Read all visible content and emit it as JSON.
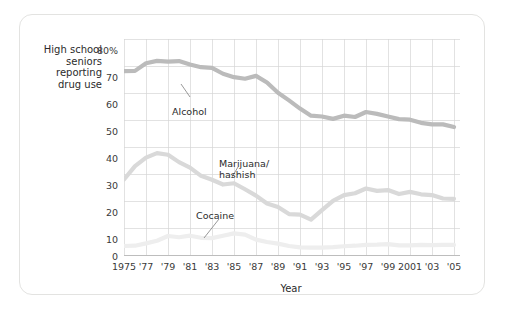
{
  "figure": {
    "y_axis_caption": "High school seniors reporting drug use",
    "y_axis_caption_lines": [
      "High school",
      "seniors",
      "reporting",
      "drug use"
    ],
    "xlabel": "Year"
  },
  "chart_data": {
    "type": "line",
    "title": "",
    "xlabel": "Year",
    "ylabel": "High school seniors reporting drug use",
    "xlim": [
      1975,
      2005
    ],
    "ylim": [
      0,
      80
    ],
    "ytick_labels": [
      "80%",
      "70",
      "60",
      "50",
      "40",
      "30",
      "20",
      "10",
      "0"
    ],
    "ytick_values": [
      80,
      70,
      60,
      50,
      40,
      30,
      20,
      10,
      0
    ],
    "xtick_labels": [
      "1975",
      "'77",
      "'79",
      "'81",
      "'83",
      "'85",
      "'87",
      "'89",
      "'91",
      "'93",
      "'95",
      "'97",
      "'99",
      "2001",
      "'03",
      "'05"
    ],
    "xtick_values": [
      1975,
      1977,
      1979,
      1981,
      1983,
      1985,
      1987,
      1989,
      1991,
      1993,
      1995,
      1997,
      1999,
      2001,
      2003,
      2005
    ],
    "grid": true,
    "legend": "inline-annotations",
    "x": [
      1975,
      1976,
      1977,
      1978,
      1979,
      1980,
      1981,
      1982,
      1983,
      1984,
      1985,
      1986,
      1987,
      1988,
      1989,
      1990,
      1991,
      1992,
      1993,
      1994,
      1995,
      1996,
      1997,
      1998,
      1999,
      2000,
      2001,
      2002,
      2003,
      2004,
      2005
    ],
    "series": [
      {
        "name": "Alcohol",
        "color": "#bbbbbb",
        "values": [
          68.2,
          68.3,
          71.2,
          72.1,
          71.8,
          72.0,
          70.7,
          69.7,
          69.4,
          67.2,
          65.9,
          65.3,
          66.4,
          63.9,
          60.0,
          57.1,
          54.0,
          51.3,
          51.0,
          50.1,
          51.3,
          50.8,
          52.7,
          52.0,
          51.0,
          50.0,
          49.8,
          48.6,
          48.0,
          48.0,
          47.0
        ]
      },
      {
        "name": "Marijuana/hashish",
        "color": "#d9d9d9",
        "values": [
          27.1,
          32.2,
          35.4,
          37.1,
          36.5,
          33.7,
          31.6,
          28.5,
          27.0,
          25.2,
          25.7,
          23.4,
          21.0,
          18.0,
          16.7,
          14.0,
          13.8,
          11.9,
          15.5,
          19.0,
          21.2,
          21.9,
          23.7,
          22.8,
          23.1,
          21.6,
          22.4,
          21.5,
          21.2,
          19.9,
          19.8
        ]
      },
      {
        "name": "Cocaine",
        "color": "#eeeeee",
        "values": [
          1.9,
          2.0,
          2.9,
          3.9,
          5.7,
          5.2,
          5.8,
          5.0,
          4.9,
          5.8,
          6.7,
          6.2,
          4.3,
          3.4,
          2.8,
          1.9,
          1.4,
          1.3,
          1.3,
          1.5,
          1.8,
          2.0,
          2.3,
          2.4,
          2.6,
          2.1,
          2.1,
          2.3,
          2.2,
          2.3,
          2.3
        ]
      }
    ],
    "annotations": [
      {
        "label": "Alcohol",
        "lines": [
          "Alcohol"
        ]
      },
      {
        "label": "Marijuana/hashish",
        "lines": [
          "Marijuana/",
          "hashish"
        ]
      },
      {
        "label": "Cocaine",
        "lines": [
          "Cocaine"
        ]
      }
    ]
  }
}
